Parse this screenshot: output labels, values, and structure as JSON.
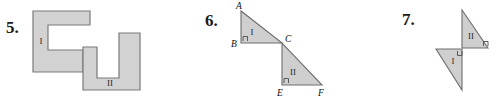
{
  "page": {
    "background_color": "#ffffff",
    "width": 502,
    "height": 103
  },
  "style": {
    "shape_fill_color": "#d2d2d2",
    "shape_stroke_color": "#7a7a7a",
    "triangle_fill_color": "#cfcfcf",
    "triangle_stroke_color": "#6e6e6e",
    "right_angle_mark_color": "#5a5a5a",
    "text_color": "#1a1a1a"
  },
  "problems": [
    {
      "number": "5.",
      "figure_type": "congruent-polygons",
      "shapes": [
        {
          "label": "I",
          "name": "c-shaped-polygon",
          "points": "33,11 90,11 90,25 48,25 48,50 83,50 83,72 33,72",
          "label_x": 41,
          "label_y": 42
        },
        {
          "label": "II",
          "name": "u-shaped-polygon",
          "points": "83,47 97,47 97,78 119,78 119,33 140,33 140,90 83,90",
          "label_x": 110,
          "label_y": 84
        }
      ]
    },
    {
      "number": "6.",
      "figure_type": "congruent-right-triangles",
      "shapes": [
        {
          "label": "I",
          "name": "triangle-abc",
          "points": "241,11 241,43 282,43",
          "label_x": 252,
          "label_y": 33,
          "right_angle": "243,41 243,36.5 247.5,36.5 247.5,41",
          "vertices": [
            {
              "name": "A",
              "text": "A",
              "x": 236,
              "y": 9
            },
            {
              "name": "B",
              "text": "B",
              "x": 231,
              "y": 47
            },
            {
              "name": "C",
              "text": "C",
              "x": 285,
              "y": 42
            }
          ]
        },
        {
          "label": "II",
          "name": "triangle-cef",
          "points": "282,43 282,85 322,85",
          "label_x": 293,
          "label_y": 73,
          "right_angle": "284,83 284,78.5 288.5,78.5 288.5,83",
          "vertices": [
            {
              "name": "E",
              "text": "E",
              "x": 277,
              "y": 96
            },
            {
              "name": "F",
              "text": "F",
              "x": 318,
              "y": 96
            }
          ]
        }
      ]
    },
    {
      "number": "7.",
      "figure_type": "congruent-right-triangles-joined",
      "shapes": [
        {
          "label": "I",
          "name": "triangle-lower-left",
          "points": "436,49 462,49 462,90",
          "label_x": 453,
          "label_y": 62,
          "right_angle": "457.5,51 457.5,55.5 462,55.5 462,51"
        },
        {
          "label": "II",
          "name": "triangle-upper-right",
          "points": "462,48 462,10 488,48",
          "label_x": 471,
          "label_y": 37,
          "right_angle": "483.5,46 483.5,41.5 488,41.5 488,46"
        }
      ]
    }
  ]
}
